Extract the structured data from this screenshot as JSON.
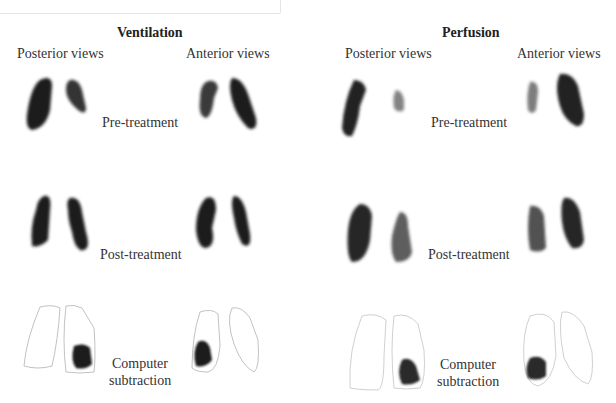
{
  "panels": [
    {
      "title": "Ventilation",
      "views": {
        "posterior": "Posterior views",
        "anterior": "Anterior views"
      },
      "rows": [
        {
          "label": "Pre-treatment"
        },
        {
          "label": "Post-treatment"
        },
        {
          "label": "Computer subtraction",
          "label_lines": [
            "Computer",
            "subtraction"
          ]
        }
      ]
    },
    {
      "title": "Perfusion",
      "views": {
        "posterior": "Posterior views",
        "anterior": "Anterior views"
      },
      "rows": [
        {
          "label": "Pre-treatment"
        },
        {
          "label": "Post-treatment"
        },
        {
          "label": "Computer subtraction",
          "label_lines": [
            "Computer",
            "subtraction"
          ]
        }
      ]
    }
  ],
  "colors": {
    "scan": "#1e1e1e",
    "outline": "#bdbdbd",
    "text": "#333333"
  }
}
